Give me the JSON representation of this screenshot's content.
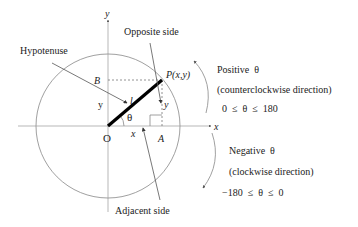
{
  "diagram": {
    "labels": {
      "y_axis": "y",
      "x_axis": "x",
      "origin": "O",
      "point_b": "B",
      "point_a": "A",
      "point_p": "P(x,y)",
      "hyp_length": "l",
      "theta": "θ",
      "y_left": "y",
      "y_right": "y",
      "x_bottom": "x",
      "hypotenuse": "Hypotenuse",
      "opposite_side": "Opposite side",
      "adjacent_side": "Adjacent side"
    },
    "positive": {
      "title": "Positive  θ",
      "direction": "(counterclockwise direction)",
      "range": "0  ≤  θ  ≤  180"
    },
    "negative": {
      "title": "Negative  θ",
      "direction": "(clockwise direction)",
      "range": "−180  ≤  θ  ≤  0"
    },
    "colors": {
      "radius_line": "#000000",
      "circle": "#888888",
      "text": "#222222"
    }
  }
}
